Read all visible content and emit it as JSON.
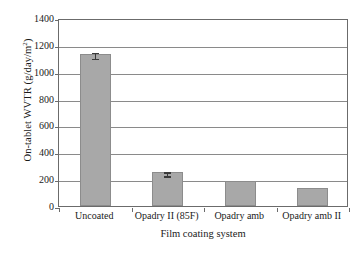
{
  "chart_data": {
    "type": "bar",
    "title": "",
    "xlabel": "Film coating system",
    "ylabel": "On-tablet WVTR (g/day/m²)",
    "ylabel_main": "On-tablet WVTR (g/day/m",
    "ylabel_sup": "2",
    "ylabel_close": ")",
    "categories": [
      "Uncoated",
      "Opadry II (85F)",
      "Opadry amb",
      "Opadry amb II"
    ],
    "values": [
      1130,
      250,
      185,
      135
    ],
    "errors": [
      22,
      15,
      0,
      0
    ],
    "ylim": [
      0,
      1400
    ],
    "yticks": [
      0,
      200,
      400,
      600,
      800,
      1000,
      1200,
      1400
    ],
    "ytick_labels": [
      "0",
      "200",
      "400",
      "600",
      "800",
      "1000",
      "1200",
      "1400"
    ],
    "grid": true,
    "grid_axis": "y",
    "legend": false,
    "bar_color": "#a8a8a8",
    "bar_edge_color": "#8c8c8c",
    "axis_color": "#6b6b6b",
    "error_bar_color": "#3a3a3a",
    "background_color": "#ffffff"
  }
}
